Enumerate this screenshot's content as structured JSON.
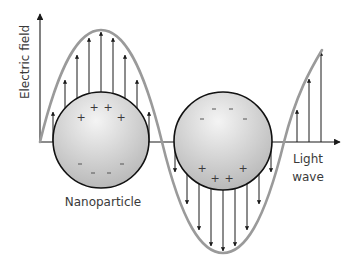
{
  "diagram": {
    "axis_label": "Electric field",
    "propagation_label_line1": "Light",
    "propagation_label_line2": "wave",
    "particle_label": "Nanoparticle",
    "colors": {
      "wave": "#9a9a9a",
      "arrows": "#1a1a1a",
      "axis": "#1a1a1a",
      "particle_fill_light": "#f2f2f2",
      "particle_fill_dark": "#b8b8b8",
      "particle_stroke": "#111111",
      "text": "#3a3a3a"
    },
    "charges": {
      "positive": "+",
      "negative": "-"
    },
    "particles": [
      {
        "name": "left-nanoparticle",
        "cx": 101,
        "cy": 140,
        "r": 48,
        "top_charge": "+",
        "bottom_charge": "-"
      },
      {
        "name": "right-nanoparticle",
        "cx": 223,
        "cy": 141,
        "r": 49,
        "top_charge": "-",
        "bottom_charge": "+"
      }
    ]
  }
}
